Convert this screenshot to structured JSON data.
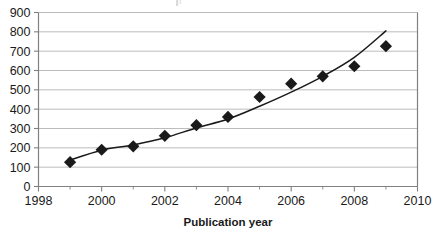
{
  "chart_data": {
    "type": "scatter",
    "title": "",
    "xlabel": "Publication year",
    "ylabel": "",
    "x": [
      1999,
      2000,
      2001,
      2002,
      2003,
      2004,
      2005,
      2006,
      2007,
      2008,
      2009
    ],
    "values": [
      126,
      190,
      208,
      262,
      317,
      360,
      463,
      532,
      570,
      622,
      726
    ],
    "series": [
      {
        "name": "Publications",
        "marker": "diamond",
        "color": "#1a1a1a",
        "x": [
          1999,
          2000,
          2001,
          2002,
          2003,
          2004,
          2005,
          2006,
          2007,
          2008,
          2009
        ],
        "values": [
          126,
          190,
          208,
          262,
          317,
          360,
          463,
          532,
          570,
          622,
          726
        ]
      },
      {
        "name": "Trend line",
        "marker": "none",
        "color": "#1a1a1a",
        "x": [
          1999,
          2000,
          2001,
          2002,
          2003,
          2004,
          2005,
          2006,
          2007,
          2008,
          2009
        ],
        "values": [
          137,
          188,
          215,
          252,
          303,
          349,
          415,
          488,
          570,
          668,
          805
        ]
      }
    ],
    "xlim": [
      1998,
      2010
    ],
    "ylim": [
      0,
      900
    ],
    "xticks": [
      1998,
      2000,
      2002,
      2004,
      2006,
      2008,
      2010
    ],
    "xtick_labels": [
      "1998",
      "2000",
      "2002",
      "2004",
      "2006",
      "2008",
      "2010"
    ],
    "xminor_ticks": [
      1999,
      2001,
      2003,
      2005,
      2007,
      2009
    ],
    "yticks": [
      0,
      100,
      200,
      300,
      400,
      500,
      600,
      700,
      800,
      900
    ],
    "ytick_labels": [
      "0",
      "100",
      "200",
      "300",
      "400",
      "500",
      "600",
      "700",
      "800",
      "900"
    ],
    "grid": "horizontal",
    "legend": "none",
    "gridline_color": "#b4b4b4",
    "axis_color": "#808080"
  },
  "axes": {
    "x_title": "Publication year",
    "y_title": ""
  }
}
